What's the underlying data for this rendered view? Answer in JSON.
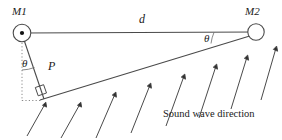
{
  "figure": {
    "type": "geometry-diagram",
    "background_color": "#ffffff",
    "stroke_color": "#333333",
    "text_color": "#1a1a1a"
  },
  "labels": {
    "mic1": "M1",
    "mic2": "M2",
    "distance": "d",
    "theta_left": "θ",
    "theta_right": "θ",
    "path_difference": "P",
    "caption": "Sound wave direction"
  },
  "geometry": {
    "mic1_center": {
      "x": 22,
      "y": 33,
      "r": 9
    },
    "mic2_center": {
      "x": 256,
      "y": 32,
      "r": 8
    },
    "baseline": {
      "x1": 22,
      "y1": 33,
      "x2": 256,
      "y2": 32
    },
    "wavefront": {
      "x1": 42,
      "y1": 99,
      "x2": 252,
      "y2": 35
    },
    "perpendicular": {
      "x1": 22,
      "y1": 33,
      "x2": 43,
      "y2": 96
    },
    "dotted_vertical": {
      "x1": 22,
      "y1": 35,
      "x2": 22,
      "y2": 101
    },
    "dotted_horizontal": {
      "x1": 22,
      "y1": 100,
      "x2": 44,
      "y2": 100
    },
    "right_angle_marker": {
      "x": 43,
      "y": 96,
      "size": 9
    },
    "wave_arrow_count": 8,
    "wave_arrow_angle_deg": -17
  },
  "annotations": {
    "arrow_direction": "arrows point up-and-right toward the wavefront line",
    "theta_meaning": "angle of arrival relative to array normal"
  }
}
